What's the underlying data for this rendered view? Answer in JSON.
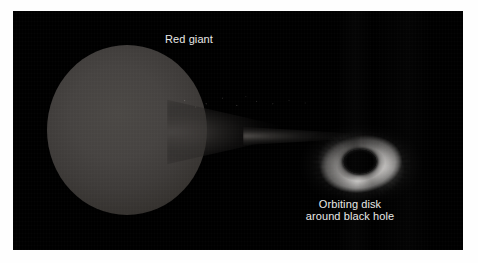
{
  "figure": {
    "kind": "astronomy-illustration",
    "background_color": "#000000",
    "page_color": "#ffffff",
    "label_color": "#e9e9e7"
  },
  "labels": {
    "red_giant": "Red giant",
    "orbiting_disk_line1": "Orbiting disk",
    "orbiting_disk_line2": "around black hole"
  },
  "objects": {
    "red_giant": {
      "name": "red-giant-star",
      "description": "Large teardrop-shaped luminous sphere on the left, tidally distorted toward the companion",
      "color": "#454240"
    },
    "accretion_stream": {
      "name": "accretion-stream",
      "description": "Narrow tapering stream of gas flowing from the red giant toward the black hole",
      "color": "#6e6a66"
    },
    "orbiting_disk": {
      "name": "accretion-disk",
      "description": "Elliptical swirling disk of glowing gas with radial filaments",
      "color": "#d7d5d3"
    },
    "black_hole": {
      "name": "black-hole",
      "description": "Dark elliptical void at the centre of the orbiting disk",
      "color": "#000000"
    }
  }
}
